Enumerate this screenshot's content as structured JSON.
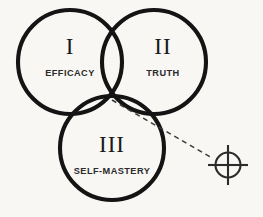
{
  "diagram": {
    "type": "venn",
    "background_color": "#f8f7f4",
    "stroke_color": "#141414",
    "text_color": "#1a1a1a",
    "label_color": "#2b2b2b",
    "pointer_color": "#3a3a3a",
    "sets": [
      {
        "id": "set-one",
        "numeral": "I",
        "label": "EFFICACY",
        "cx": 70,
        "cy": 62,
        "r": 52,
        "numeral_x": 70,
        "numeral_y": 54,
        "label_x": 70,
        "label_y": 76
      },
      {
        "id": "set-two",
        "numeral": "II",
        "label": "TRUTH",
        "cx": 154,
        "cy": 62,
        "r": 52,
        "numeral_x": 163,
        "numeral_y": 54,
        "label_x": 163,
        "label_y": 76
      },
      {
        "id": "set-three",
        "numeral": "III",
        "label": "SELF-MASTERY",
        "cx": 112,
        "cy": 148,
        "r": 52,
        "numeral_x": 112,
        "numeral_y": 152,
        "label_x": 112,
        "label_y": 174
      }
    ],
    "pointer": {
      "id": "pointer-line",
      "from_x": 112,
      "from_y": 100,
      "to_x": 212,
      "to_y": 158,
      "dash_pattern": "5 4"
    },
    "target": {
      "id": "target-crosshair",
      "cx": 228,
      "cy": 165,
      "ring_radius": 12.5,
      "arm_length": 20,
      "dot_radius": 1.6
    }
  },
  "chart_data": {
    "type": "venn",
    "categories": [
      "EFFICACY",
      "TRUTH",
      "SELF-MASTERY"
    ],
    "set_numerals": [
      "I",
      "II",
      "III"
    ],
    "centers": [
      [
        70,
        62
      ],
      [
        154,
        62
      ],
      [
        112,
        148
      ]
    ],
    "radii": [
      52,
      52,
      52
    ],
    "annotations": [
      {
        "kind": "dashed-pointer",
        "from": [
          112,
          100
        ],
        "to": [
          212,
          158
        ],
        "note": "points from the triple-intersection center to the crosshair target"
      },
      {
        "kind": "crosshair-target",
        "at": [
          228,
          165
        ]
      }
    ],
    "legend": null,
    "grid": false
  }
}
